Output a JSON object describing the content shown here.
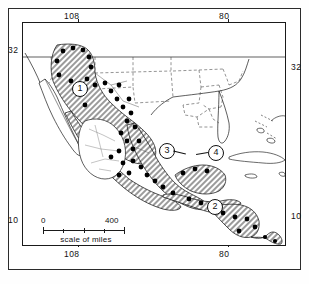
{
  "figure": {
    "kind": "distribution-map",
    "region_described": "Mexico, Central America and southern United States",
    "scale": {
      "start_label": "0",
      "end_label": "400",
      "caption": "scale of miles"
    }
  },
  "axis_labels": {
    "top_left_longitude": "108",
    "top_right_longitude": "80",
    "bottom_left_longitude": "108",
    "bottom_right_longitude": "80",
    "left_upper_latitude": "32",
    "right_upper_latitude": "32",
    "left_lower_latitude": "10",
    "right_lower_latitude": "10",
    "inset_corner_tick": "104"
  },
  "region_markers": [
    {
      "id": "1",
      "label": "1"
    },
    {
      "id": "2",
      "label": "2"
    },
    {
      "id": "3",
      "label": "3"
    },
    {
      "id": "4",
      "label": "4"
    }
  ],
  "colors": {
    "ink": "#1a1a1a",
    "frame": "#2b2b2b",
    "land_fill": "#ffffff",
    "range_hatch": "#9b9b9b",
    "locality_dot": "#000000"
  }
}
